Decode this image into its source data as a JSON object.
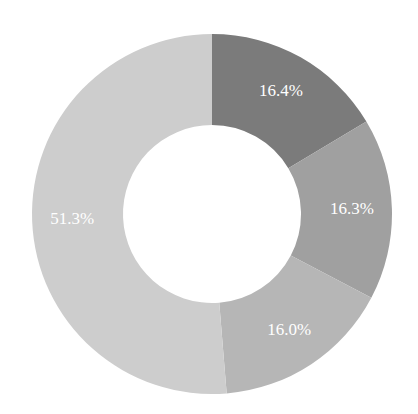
{
  "chart_data": {
    "type": "pie",
    "variant": "donut",
    "title": "",
    "categories": [
      "Segment 1",
      "Segment 2",
      "Segment 3",
      "Segment 4"
    ],
    "values": [
      16.4,
      16.3,
      16.0,
      51.3
    ],
    "labels": [
      "16.4%",
      "16.3%",
      "16.0%",
      "51.3%"
    ],
    "colors": [
      "#7b7b7b",
      "#a0a0a0",
      "#b6b6b6",
      "#cdcdcd"
    ],
    "start_angle_deg": 0,
    "direction": "clockwise",
    "legend": "none",
    "geometry": {
      "cx": 212,
      "cy": 214,
      "outer_radius": 180,
      "inner_radius": 89,
      "label_radius": 140
    }
  }
}
